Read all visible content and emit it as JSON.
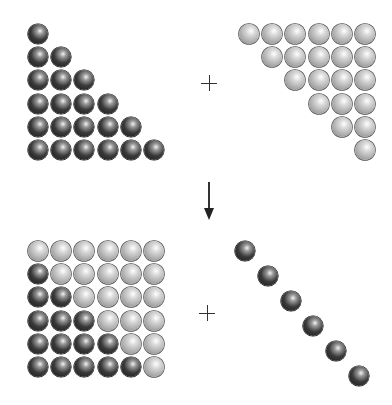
{
  "diagram": {
    "colors": {
      "dark_ball": "#2a2a2a",
      "light_ball": "#b8b8b8",
      "symbol": "#333333"
    },
    "symbols": {
      "plus_top": "+",
      "plus_bottom": "+",
      "arrow": "down-arrow"
    },
    "panels": [
      {
        "name": "top-left",
        "shape": "lower-left triangle",
        "color": "dark",
        "rows": [
          1,
          2,
          3,
          4,
          5,
          6
        ],
        "count": 21
      },
      {
        "name": "top-right",
        "shape": "upper-right triangle",
        "color": "light",
        "rows": [
          6,
          5,
          4,
          3,
          2,
          1
        ],
        "count": 21
      },
      {
        "name": "bottom-left",
        "shape": "6x6 square, dark lower-left triangle below diagonal, light elsewhere",
        "grid": [
          "LLLLLL",
          "DLLLLL",
          "DDLLLL",
          "DDDLLL",
          "DDDDLL",
          "DDDDDL"
        ],
        "count": 36
      },
      {
        "name": "bottom-right",
        "shape": "diagonal",
        "color": "dark",
        "count": 6
      }
    ]
  }
}
